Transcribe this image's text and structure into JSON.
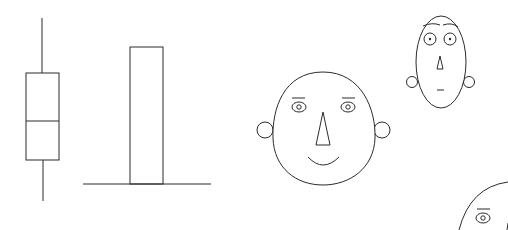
{
  "figure": {
    "kind": "line-art illustration",
    "stroke_color": "#2b2b2b",
    "background": "#ffffff",
    "elements": [
      {
        "name": "box-and-whisker",
        "whisker_top": 18,
        "box_top": 73,
        "median": 121,
        "box_bottom": 160,
        "whisker_bottom": 201,
        "x_left": 26,
        "x_right": 59
      },
      {
        "name": "single-bar",
        "bar_top": 47,
        "baseline": 184,
        "bar_left": 130,
        "bar_right": 163,
        "baseline_left": 83,
        "baseline_right": 211
      },
      {
        "name": "face-large",
        "expression": "smiling",
        "features": [
          "ears",
          "eyebrows",
          "eyes",
          "triangle-nose",
          "smile"
        ]
      },
      {
        "name": "face-small-oval",
        "expression": "neutral",
        "features": [
          "ears",
          "eyebrows",
          "large-eyes",
          "small-triangle-nose",
          "short-mouth"
        ]
      },
      {
        "name": "face-partial-cropped",
        "expression": "unknown",
        "features": [
          "eyebrow",
          "eye"
        ]
      }
    ]
  }
}
